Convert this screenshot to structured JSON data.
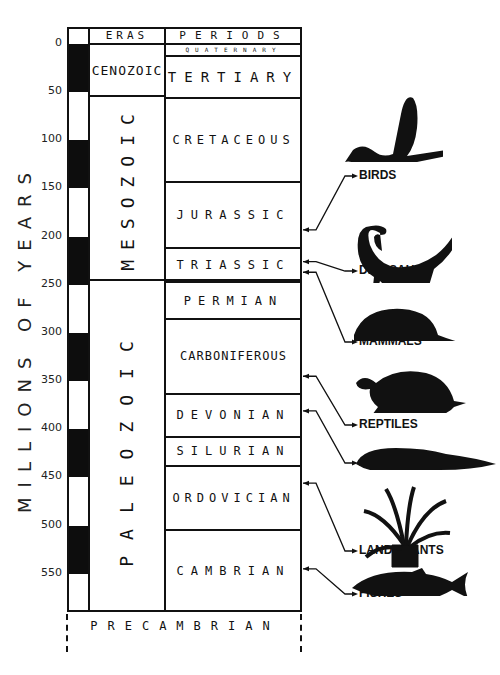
{
  "axis_label": "MILLIONS OF YEARS",
  "headers": {
    "eras": "ERAS",
    "periods": "PERIODS"
  },
  "scale": {
    "ticks": [
      "0",
      "50",
      "100",
      "150",
      "200",
      "250",
      "300",
      "350",
      "400",
      "450",
      "500",
      "550"
    ],
    "bands_myr": [
      [
        0,
        50,
        "dark"
      ],
      [
        50,
        100,
        "light"
      ],
      [
        100,
        150,
        "dark"
      ],
      [
        150,
        200,
        "light"
      ],
      [
        200,
        250,
        "dark"
      ],
      [
        250,
        300,
        "light"
      ],
      [
        300,
        350,
        "dark"
      ],
      [
        350,
        400,
        "light"
      ],
      [
        400,
        450,
        "dark"
      ],
      [
        450,
        500,
        "light"
      ],
      [
        500,
        550,
        "dark"
      ],
      [
        550,
        570,
        "light"
      ]
    ]
  },
  "eras": [
    {
      "name": "CENOZOIC",
      "start": 0,
      "end": 54
    },
    {
      "name": "MESOZOIC",
      "start": 54,
      "end": 245
    },
    {
      "name": "PALEOZOIC",
      "start": 245,
      "end": 590
    }
  ],
  "periods": [
    {
      "name": "QUATERNARY",
      "start": 0,
      "end": 12
    },
    {
      "name": "TERTIARY",
      "start": 12,
      "end": 56
    },
    {
      "name": "CRETACEOUS",
      "start": 56,
      "end": 143
    },
    {
      "name": "JURASSIC",
      "start": 143,
      "end": 212
    },
    {
      "name": "TRIASSIC",
      "start": 212,
      "end": 247
    },
    {
      "name": "PERMIAN",
      "start": 247,
      "end": 286
    },
    {
      "name": "CARBONIFEROUS",
      "start": 286,
      "end": 363
    },
    {
      "name": "DEVONIAN",
      "start": 363,
      "end": 408
    },
    {
      "name": "SILURIAN",
      "start": 408,
      "end": 438
    },
    {
      "name": "ORDOVICIAN",
      "start": 438,
      "end": 505
    },
    {
      "name": "CAMBRIAN",
      "start": 505,
      "end": 590
    }
  ],
  "precambrian": "PRECAMBRIAN",
  "life_forms": [
    {
      "label": "BIRDS",
      "icon": "bird-silhouette-icon",
      "origin_myr": 193
    },
    {
      "label": "DINOSAURS",
      "icon": "dinosaur-silhouette-icon",
      "origin_myr": 226
    },
    {
      "label": "MAMMALS",
      "icon": "mammal-silhouette-icon",
      "origin_myr": 237
    },
    {
      "label": "REPTILES",
      "icon": "turtle-silhouette-icon",
      "origin_myr": 345
    },
    {
      "label": "AMPHIBIANS",
      "icon": "amphibian-silhouette-icon",
      "origin_myr": 381
    },
    {
      "label": "LAND PLANTS",
      "icon": "cycad-plant-silhouette-icon",
      "origin_myr": 456
    },
    {
      "label": "FISHES",
      "icon": "fish-silhouette-icon",
      "origin_myr": 545
    }
  ]
}
